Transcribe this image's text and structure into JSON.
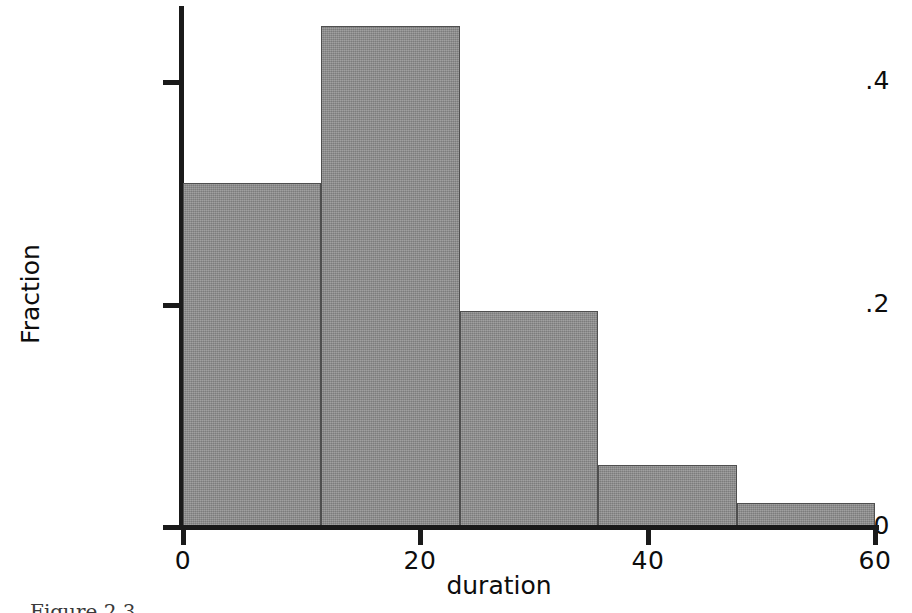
{
  "chart_data": {
    "type": "bar",
    "title": "",
    "subtitle": "",
    "xlabel": "duration",
    "ylabel": "Fraction",
    "categories": [
      "0-12",
      "12-24",
      "24-36",
      "36-48",
      "48-60"
    ],
    "bin_edges": [
      0,
      12,
      24,
      36,
      48,
      60
    ],
    "values": [
      0.31,
      0.452,
      0.195,
      0.056,
      0.022
    ],
    "x_ticks": [
      0,
      20,
      40,
      60
    ],
    "x_tick_labels": [
      "0",
      "20",
      "40",
      "60"
    ],
    "y_ticks": [
      0,
      0.2,
      0.4
    ],
    "y_tick_labels": [
      "0",
      ".2",
      ".4"
    ],
    "xlim": [
      0,
      60
    ],
    "ylim": [
      0,
      0.47
    ],
    "grid": false,
    "legend": null,
    "bar_color": "#8b8b8b",
    "bar_edge_color": "#4f4f4f",
    "axis_color": "#1a1a1a",
    "background_color": "#ffffff"
  },
  "figure": {
    "caption_fragment": "Figure 2.3"
  }
}
